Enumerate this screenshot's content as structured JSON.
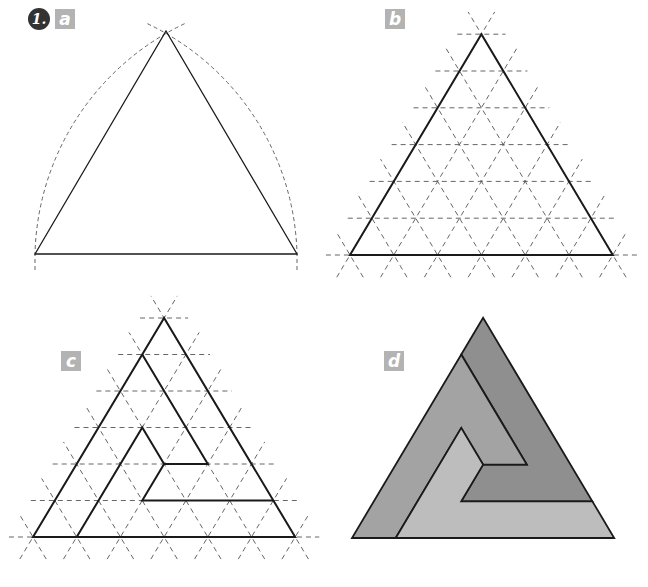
{
  "figure": {
    "step_number": "1.",
    "panels": [
      {
        "id": "a",
        "label": "a",
        "description": "Equilateral triangle constructed with compass arcs"
      },
      {
        "id": "b",
        "label": "b",
        "description": "Triangle subdivided with dashed triangular grid (6 divisions per side)"
      },
      {
        "id": "c",
        "label": "c",
        "description": "Spiral outline drawn on the triangular grid"
      },
      {
        "id": "d",
        "label": "d",
        "description": "Filled spiral triangle in three shades of gray"
      }
    ],
    "colors": {
      "line": "#1a1a1a",
      "guide": "#555555",
      "label_bg": "#b3b3b3",
      "badge_bg": "#333333",
      "shade_dark": "#8f8f8f",
      "shade_mid": "#a3a3a3",
      "shade_light": "#bdbdbd"
    },
    "grid_divisions": 6
  }
}
